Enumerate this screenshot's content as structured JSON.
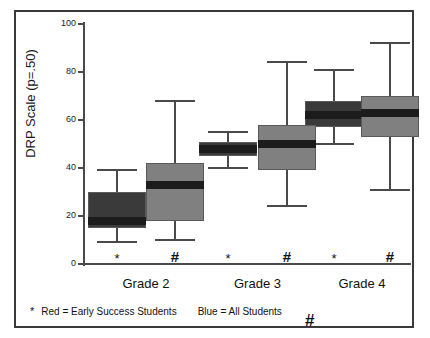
{
  "chart_data": {
    "type": "box",
    "title": "",
    "xlabel": "",
    "ylabel": "DRP Scale (p=.50)",
    "ylim": [
      0,
      100
    ],
    "yticks": [
      0,
      20,
      40,
      60,
      80,
      100
    ],
    "grid": false,
    "categories": [
      "Grade 2",
      "Grade 3",
      "Grade 4"
    ],
    "legend_position": "below-axis",
    "series": [
      {
        "name": "Red = Early Success Students",
        "marker": "*",
        "color": "#3a3a3a",
        "boxes": [
          {
            "category": "Grade 2",
            "min": 9,
            "q1": 15,
            "median": 18,
            "q3": 30,
            "max": 39
          },
          {
            "category": "Grade 3",
            "min": 40,
            "q1": 45,
            "median": 48,
            "q3": 51,
            "max": 55
          },
          {
            "category": "Grade 4",
            "min": 50,
            "q1": 57,
            "median": 62,
            "q3": 68,
            "max": 81
          }
        ]
      },
      {
        "name": "Blue = All Students",
        "marker": "#",
        "color": "#808080",
        "boxes": [
          {
            "category": "Grade 2",
            "min": 10,
            "q1": 18,
            "median": 33,
            "q3": 42,
            "max": 68
          },
          {
            "category": "Grade 3",
            "min": 24,
            "q1": 39,
            "median": 50,
            "q3": 58,
            "max": 84
          },
          {
            "category": "Grade 4",
            "min": 31,
            "q1": 53,
            "median": 63,
            "q3": 70,
            "max": 92
          }
        ]
      }
    ]
  },
  "axis": {
    "y_label": "DRP Scale (p=.50)",
    "y_tick_labels": [
      "100",
      "80",
      "60",
      "40",
      "20",
      "0"
    ]
  },
  "groups": [
    {
      "label": "Grade 2",
      "star_marker": "*",
      "hash_marker": "#"
    },
    {
      "label": "Grade 3",
      "star_marker": "*",
      "hash_marker": "#"
    },
    {
      "label": "Grade 4",
      "star_marker": "*",
      "hash_marker": "#"
    }
  ],
  "legend": {
    "star_symbol": "*",
    "red_text": "Red = Early Success Students",
    "blue_text": "Blue = All Students",
    "hash_symbol": "#"
  },
  "colors": {
    "red_series": "#3a3a3a",
    "blue_series": "#808080",
    "median_line": "#1c1c1c",
    "axis": "#4a4a4a",
    "frame": "#3a3a3a"
  }
}
